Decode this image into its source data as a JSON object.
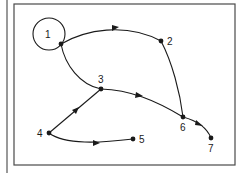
{
  "diagram": {
    "type": "directed-graph",
    "colors": {
      "stroke": "#1a1a1a",
      "frame": "#4a4a4a",
      "background": "#ffffff"
    },
    "highlight_circle": {
      "node": "1",
      "cx": 49,
      "cy": 34,
      "r": 16
    },
    "nodes": [
      {
        "id": "1",
        "label": "1",
        "x": 61,
        "y": 44
      },
      {
        "id": "2",
        "label": "2",
        "x": 161,
        "y": 41
      },
      {
        "id": "3",
        "label": "3",
        "x": 101,
        "y": 89
      },
      {
        "id": "4",
        "label": "4",
        "x": 49,
        "y": 133
      },
      {
        "id": "5",
        "label": "5",
        "x": 133,
        "y": 139
      },
      {
        "id": "6",
        "label": "6",
        "x": 183,
        "y": 117
      },
      {
        "id": "7",
        "label": "7",
        "x": 211,
        "y": 138
      }
    ],
    "edges": [
      {
        "from": "1",
        "to": "2",
        "directed": true
      },
      {
        "from": "1",
        "to": "3",
        "directed": false
      },
      {
        "from": "2",
        "to": "6",
        "directed": false
      },
      {
        "from": "3",
        "to": "6",
        "directed": true
      },
      {
        "from": "4",
        "to": "3",
        "directed": true
      },
      {
        "from": "4",
        "to": "5",
        "directed": true
      },
      {
        "from": "6",
        "to": "7",
        "directed": true
      }
    ]
  }
}
